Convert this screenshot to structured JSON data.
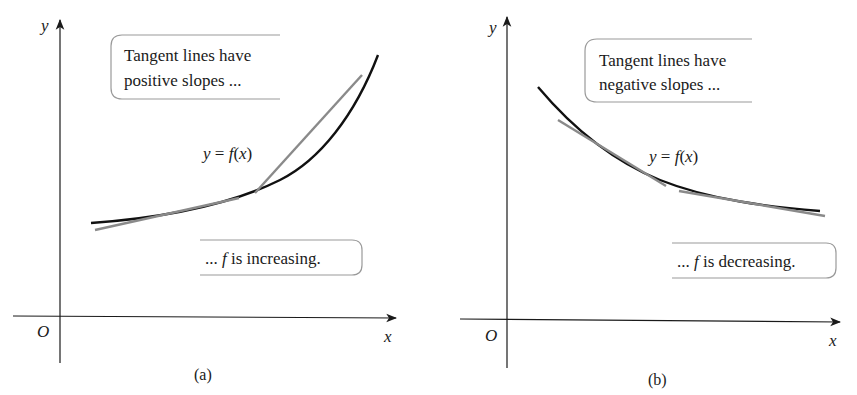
{
  "panels": [
    {
      "id": "a",
      "caption": "(a)",
      "axis_x_label": "x",
      "axis_y_label": "y",
      "origin_label": "O",
      "function_label": "y = f(x)",
      "function_label_parts": {
        "y": "y",
        "eq": " = ",
        "f": "f",
        "paren_open": "(",
        "x": "x",
        "paren_close": ")"
      },
      "callout_top": {
        "line1": "Tangent lines have",
        "line2": "positive slopes ..."
      },
      "callout_bottom": {
        "prefix": "... ",
        "f": "f",
        "suffix": " is increasing."
      },
      "curve_type": "increasing",
      "tangent_count": 2
    },
    {
      "id": "b",
      "caption": "(b)",
      "axis_x_label": "x",
      "axis_y_label": "y",
      "origin_label": "O",
      "function_label": "y = f(x)",
      "function_label_parts": {
        "y": "y",
        "eq": " = ",
        "f": "f",
        "paren_open": "(",
        "x": "x",
        "paren_close": ")"
      },
      "callout_top": {
        "line1": "Tangent lines have",
        "line2": "negative slopes ..."
      },
      "callout_bottom": {
        "prefix": "... ",
        "f": "f",
        "suffix": " is decreasing."
      },
      "curve_type": "decreasing",
      "tangent_count": 2
    }
  ],
  "colors": {
    "curve": "#111111",
    "tangent": "#8a8a8a",
    "axis": "#1a1a1a",
    "callout_border": "#9a9a9a"
  }
}
